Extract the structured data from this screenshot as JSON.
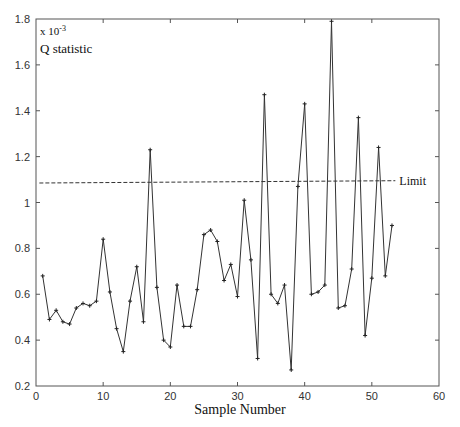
{
  "chart_data": {
    "type": "line",
    "title": "",
    "annotation_scale": "x 10",
    "annotation_exp": "-3",
    "annotation_label": "Q statistic",
    "xlabel": "Sample Number",
    "ylabel": "",
    "xlim": [
      0,
      60
    ],
    "ylim": [
      0.2,
      1.8
    ],
    "xticks": [
      0,
      10,
      20,
      30,
      40,
      50,
      60
    ],
    "yticks": [
      0.2,
      0.4,
      0.6,
      0.8,
      1,
      1.2,
      1.4,
      1.6,
      1.8
    ],
    "grid": false,
    "limit": {
      "label": "Limit",
      "value_start": 1.085,
      "value_end": 1.095,
      "x_start": 0.5,
      "x_end": 53.5
    },
    "series": [
      {
        "name": "Q statistic",
        "marker": "+",
        "x": [
          1,
          2,
          3,
          4,
          5,
          6,
          7,
          8,
          9,
          10,
          11,
          12,
          13,
          14,
          15,
          16,
          17,
          18,
          19,
          20,
          21,
          22,
          23,
          24,
          25,
          26,
          27,
          28,
          29,
          30,
          31,
          32,
          33,
          34,
          35,
          36,
          37,
          38,
          39,
          40,
          41,
          42,
          43,
          44,
          45,
          46,
          47,
          48,
          49,
          50,
          51,
          52,
          53
        ],
        "values": [
          0.68,
          0.49,
          0.53,
          0.48,
          0.47,
          0.54,
          0.56,
          0.55,
          0.57,
          0.84,
          0.61,
          0.45,
          0.35,
          0.57,
          0.72,
          0.48,
          1.23,
          0.63,
          0.4,
          0.37,
          0.64,
          0.46,
          0.46,
          0.62,
          0.86,
          0.88,
          0.83,
          0.66,
          0.73,
          0.59,
          1.01,
          0.75,
          0.32,
          1.47,
          0.6,
          0.56,
          0.64,
          0.27,
          1.07,
          1.43,
          0.6,
          0.61,
          0.64,
          1.79,
          0.54,
          0.55,
          0.71,
          1.37,
          0.42,
          0.67,
          1.24,
          0.68,
          0.9
        ]
      }
    ]
  },
  "colors": {
    "line": "#333333",
    "axis": "#555555",
    "limit": "#333333"
  }
}
